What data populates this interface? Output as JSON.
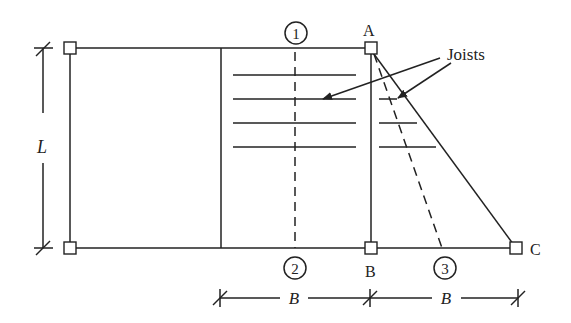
{
  "diagram": {
    "type": "structural floor framing plan",
    "labels": {
      "point_a": "A",
      "point_b": "B",
      "point_c": "C",
      "joists": "Joists",
      "dim_length": "L",
      "dim_width_1": "B",
      "dim_width_2": "B"
    },
    "gridlines": [
      {
        "id": "1",
        "label": "1",
        "style": "dashed"
      },
      {
        "id": "2",
        "label": "2",
        "style": "dashed"
      },
      {
        "id": "3",
        "label": "3",
        "style": "dashed"
      }
    ],
    "joist_counts": {
      "rectangular_bay": 4,
      "triangular_bay": 3
    },
    "colors": {
      "line": "#222222",
      "background": "#ffffff"
    }
  }
}
